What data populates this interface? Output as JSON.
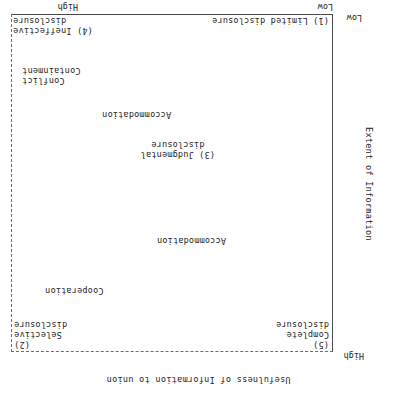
{
  "figure": {
    "orientation": "rotated-180",
    "type": "2x2-matrix-diagram",
    "axes": {
      "x": {
        "title": "Usefulness of Information to union",
        "low_label": "Low",
        "high_label": "High"
      },
      "y": {
        "title": "Extent of Information",
        "low_label": "Low",
        "high_label": "High"
      }
    },
    "quadrants": {
      "bottom_left": "(1) Limited disclosure",
      "bottom_right": "(4) Ineffective\ndisclosure",
      "top_right": "(2)\nSelective\ndisclosure",
      "top_left": "(5)\nComplete\ndisclosure",
      "center": "(3) Judgmental\ndisclosure"
    },
    "concepts": {
      "conflict_containment": "Conflict\nContainment",
      "accommodation_lower": "Accommodation",
      "accommodation_upper": "Accommodation",
      "cooperation": "Cooperation"
    },
    "colors": {
      "ink": "#262626",
      "axis": "#4a4a4a",
      "grid": "#6d6d6d",
      "background": "#ffffff"
    }
  },
  "chart_data": {
    "type": "scatter",
    "title": "",
    "xlabel": "Usefulness of Information to union",
    "ylabel": "Extent of Information",
    "xlim": [
      0,
      1
    ],
    "ylim": [
      0,
      1
    ],
    "xtick_labels": [
      "Low",
      "High"
    ],
    "ytick_labels": [
      "Low",
      "High"
    ],
    "grid": "dashed top and right frame only",
    "legend": "none",
    "annotations": [
      {
        "label": "(1) Limited disclosure",
        "x": 0.02,
        "y": 0.02,
        "role": "quadrant-corner"
      },
      {
        "label": "(4) Ineffective disclosure",
        "x": 0.98,
        "y": 0.04,
        "role": "quadrant-corner"
      },
      {
        "label": "(3) Judgmental disclosure",
        "x": 0.42,
        "y": 0.41,
        "role": "quadrant-center"
      },
      {
        "label": "(2) Selective disclosure",
        "x": 0.98,
        "y": 0.96,
        "role": "quadrant-corner"
      },
      {
        "label": "(5) Complete disclosure",
        "x": 0.02,
        "y": 0.97,
        "role": "quadrant-corner"
      },
      {
        "label": "Conflict Containment",
        "x": 0.87,
        "y": 0.19,
        "role": "concept"
      },
      {
        "label": "Accommodation",
        "x": 0.52,
        "y": 0.32,
        "role": "concept"
      },
      {
        "label": "Accommodation",
        "x": 0.48,
        "y": 0.67,
        "role": "concept"
      },
      {
        "label": "Cooperation",
        "x": 0.17,
        "y": 0.83,
        "role": "concept"
      }
    ]
  }
}
